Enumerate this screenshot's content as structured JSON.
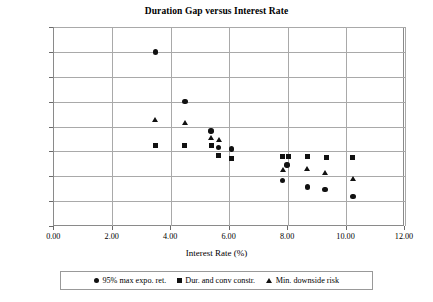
{
  "chart_data": {
    "type": "scatter",
    "title": "Duration Gap versus Interest Rate",
    "xlabel": "Interest Rate (%)",
    "ylabel": "Duration Gap (%)",
    "xlim": [
      0.0,
      12.0
    ],
    "ylim": [
      -6.0,
      10.0
    ],
    "xticks": [
      "0.00",
      "2.00",
      "4.00",
      "6.00",
      "8.00",
      "10.00",
      "12.00"
    ],
    "xtick_values": [
      0,
      2,
      4,
      6,
      8,
      10,
      12
    ],
    "yticks": [
      "10.00",
      "8.00",
      "6.00",
      "4.00",
      "2.00",
      "0.00",
      "-2.00",
      "-4.00",
      "-6.00"
    ],
    "ytick_values": [
      10,
      8,
      6,
      4,
      2,
      0,
      -2,
      -4,
      -6
    ],
    "grid": "horizontal-and-vertical",
    "legend_position": "bottom",
    "series": [
      {
        "name": "95% max expo. ret.",
        "marker": "circle",
        "color": "#111111",
        "points": [
          {
            "x": 3.5,
            "y": 8.0
          },
          {
            "x": 4.5,
            "y": 4.0
          },
          {
            "x": 5.4,
            "y": 1.65
          },
          {
            "x": 5.65,
            "y": 0.3
          },
          {
            "x": 6.1,
            "y": 0.2
          },
          {
            "x": 8.0,
            "y": -1.1
          },
          {
            "x": 7.85,
            "y": -2.35
          },
          {
            "x": 8.7,
            "y": -2.85
          },
          {
            "x": 9.3,
            "y": -3.05
          },
          {
            "x": 10.25,
            "y": -3.65
          }
        ]
      },
      {
        "name": "Dur. and conv constr.",
        "marker": "square",
        "color": "#111111",
        "points": [
          {
            "x": 3.5,
            "y": 0.5
          },
          {
            "x": 4.5,
            "y": 0.5
          },
          {
            "x": 5.4,
            "y": 0.5
          },
          {
            "x": 5.65,
            "y": -0.35
          },
          {
            "x": 6.1,
            "y": -0.55
          },
          {
            "x": 7.85,
            "y": -0.45
          },
          {
            "x": 8.05,
            "y": -0.45
          },
          {
            "x": 8.7,
            "y": -0.45
          },
          {
            "x": 9.35,
            "y": -0.5
          },
          {
            "x": 10.25,
            "y": -0.5
          }
        ]
      },
      {
        "name": "Min. downside risk",
        "marker": "triangle",
        "color": "#111111",
        "points": [
          {
            "x": 3.5,
            "y": 2.5
          },
          {
            "x": 4.5,
            "y": 2.3
          },
          {
            "x": 5.4,
            "y": 1.1
          },
          {
            "x": 5.68,
            "y": 0.9
          },
          {
            "x": 7.85,
            "y": -1.5
          },
          {
            "x": 8.7,
            "y": -1.45
          },
          {
            "x": 9.3,
            "y": -1.75
          },
          {
            "x": 10.25,
            "y": -2.2
          }
        ]
      }
    ]
  }
}
